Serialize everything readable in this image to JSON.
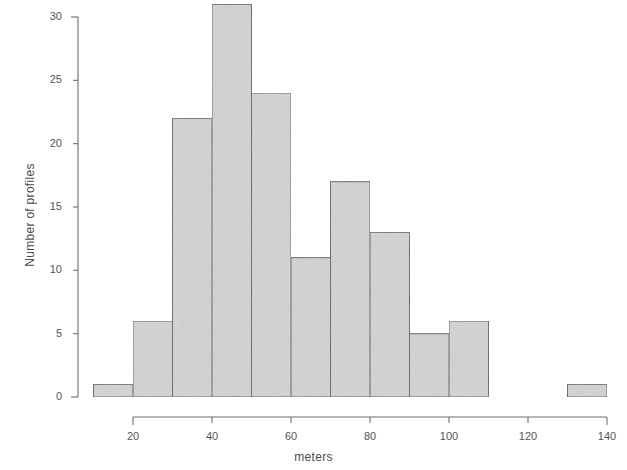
{
  "chart_data": {
    "type": "bar",
    "title": "",
    "subtitle": "",
    "xlabel": "meters",
    "ylabel": "Number of profiles",
    "categories": [
      "10-20",
      "20-30",
      "30-40",
      "40-50",
      "50-60",
      "60-70",
      "70-80",
      "80-90",
      "90-100",
      "100-110",
      "110-120",
      "120-130",
      "130-140"
    ],
    "bin_edges": [
      10,
      20,
      30,
      40,
      50,
      60,
      70,
      80,
      90,
      100,
      110,
      120,
      130,
      140
    ],
    "bin_width": 10,
    "values": [
      1,
      6,
      22,
      31,
      24,
      11,
      17,
      13,
      5,
      6,
      0,
      0,
      1
    ],
    "xlim": [
      10,
      140
    ],
    "ylim": [
      0,
      31
    ],
    "xticks": [
      20,
      40,
      60,
      80,
      100,
      120,
      140
    ],
    "xtick_labels": [
      "20",
      "40",
      "60",
      "80",
      "100",
      "120",
      "140"
    ],
    "yticks": [
      0,
      5,
      10,
      15,
      20,
      25,
      30
    ],
    "ytick_labels": [
      "0",
      "5",
      "10",
      "15",
      "20",
      "25",
      "30"
    ],
    "grid": false,
    "legend": null,
    "bar_fill_color": "#d4d4d4",
    "bar_border_color": "#5a5a5a",
    "axis_color": "#6e6e6e",
    "text_color": "#4a4a4a",
    "background_color": "#ffffff"
  },
  "plot_geometry": {
    "x_axis_pixel_start": 133,
    "x_axis_pixel_end": 607,
    "y_axis_pixel_zero": 397,
    "y_axis_pixel_top": 17,
    "y_axis_line_x": 78,
    "x_axis_line_y": 417
  }
}
